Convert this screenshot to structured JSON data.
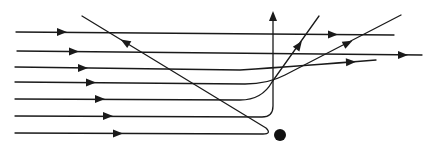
{
  "diagram": {
    "stroke_color": "#1a1a1a",
    "target": {
      "label": "target-nucleus",
      "cx": 280,
      "cy": 135,
      "r": 6,
      "color": "#111111"
    },
    "paths": [
      {
        "id": "path-1",
        "shape": "straight",
        "d": "M16,32 L394,35",
        "arrows": [
          {
            "x": 62,
            "y": 32,
            "angle": 0
          },
          {
            "x": 333,
            "y": 34.5,
            "angle": 0
          }
        ]
      },
      {
        "id": "path-2",
        "shape": "straight",
        "d": "M17,51 L422,55",
        "arrows": [
          {
            "x": 74,
            "y": 51.5,
            "angle": 0
          },
          {
            "x": 403,
            "y": 55,
            "angle": 0
          }
        ]
      },
      {
        "id": "path-3",
        "shape": "slight-deflection",
        "d": "M15,67 L240,70 Q300,66 376,60",
        "arrows": [
          {
            "x": 83,
            "y": 68,
            "angle": 0
          },
          {
            "x": 351,
            "y": 62,
            "angle": -3
          }
        ]
      },
      {
        "id": "path-4",
        "shape": "moderate-deflection",
        "d": "M15,82 L245,84 Q268,84 285,75 L401,15",
        "arrows": [
          {
            "x": 91,
            "y": 82.5,
            "angle": 0
          },
          {
            "x": 348,
            "y": 43,
            "angle": -27
          }
        ]
      },
      {
        "id": "path-5",
        "shape": "large-deflection",
        "d": "M15,99 L240,100 Q262,100 272,82 L319,16",
        "arrows": [
          {
            "x": 100,
            "y": 99,
            "angle": 0
          },
          {
            "x": 299,
            "y": 45,
            "angle": -55
          }
        ]
      },
      {
        "id": "path-6",
        "shape": "right-angle-deflection",
        "d": "M15,116 L262,117 Q273,117 273,106 L273,14",
        "arrows": [
          {
            "x": 108,
            "y": 116,
            "angle": 0
          },
          {
            "x": 273,
            "y": 16,
            "angle": -90
          }
        ]
      },
      {
        "id": "path-7",
        "shape": "backscatter",
        "d": "M15,133 L263,134 Q272,134 266,128 L82,16",
        "arrows": [
          {
            "x": 118,
            "y": 133.5,
            "angle": 0
          },
          {
            "x": 125,
            "y": 42,
            "angle": 211.3
          }
        ]
      }
    ]
  }
}
